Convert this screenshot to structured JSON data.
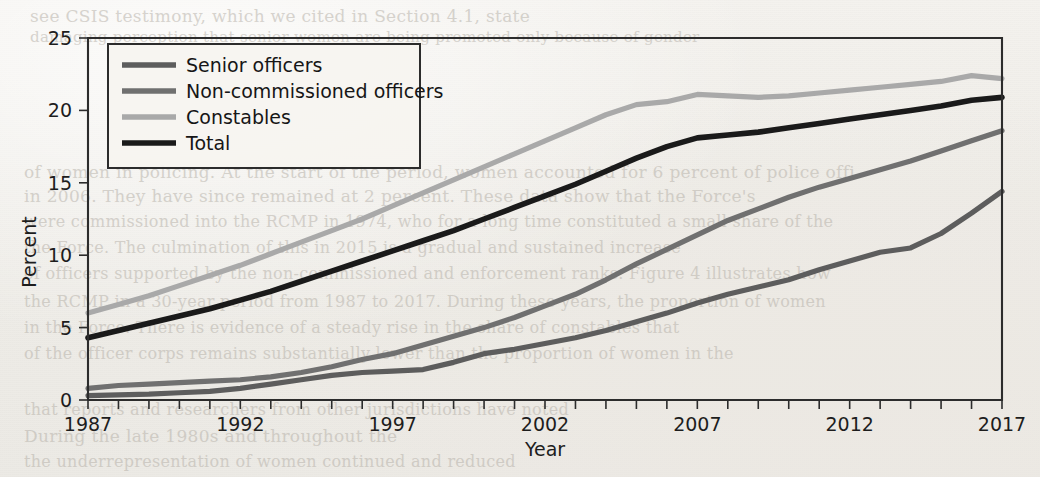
{
  "figure": {
    "background_color": "#f1efeb",
    "frame_color": "#2c2c2c"
  },
  "bleed_through_text": [
    {
      "text": "see CSIS testimony, which we cited in Section 4.1, state",
      "x": 30,
      "y": 6,
      "size": 17
    },
    {
      "text": "damaging perception that senior women are being promoted only because of gender",
      "x": 30,
      "y": 28,
      "size": 15
    },
    {
      "text": "of women in policing. At the start of the period, women accounted for 6 percent of police offi",
      "x": 24,
      "y": 162,
      "size": 17
    },
    {
      "text": "in 2006. They have since remained at 2 percent. These data show that the Force's",
      "x": 24,
      "y": 186,
      "size": 17
    },
    {
      "text": "were commissioned into the RCMP in 1974, who for a long time constituted a small share of the",
      "x": 24,
      "y": 212,
      "size": 16
    },
    {
      "text": "the Force. The culmination of this in 2015 is a gradual and sustained increase",
      "x": 24,
      "y": 238,
      "size": 16
    },
    {
      "text": "of officers supported by the non-commissioned and enforcement ranks. Figure 4 illustrates how",
      "x": 24,
      "y": 264,
      "size": 16
    },
    {
      "text": "the RCMP in a 30-year period from 1987 to 2017. During these years, the proportion of women",
      "x": 24,
      "y": 292,
      "size": 16
    },
    {
      "text": "in the Force. There is evidence of a steady rise in the share of constables that",
      "x": 24,
      "y": 318,
      "size": 16
    },
    {
      "text": "of the officer corps remains substantially lower than the proportion of women in the",
      "x": 24,
      "y": 344,
      "size": 16
    },
    {
      "text": "that reports and researchers from other jurisdictions have noted",
      "x": 24,
      "y": 400,
      "size": 16
    },
    {
      "text": "During the late 1980s and throughout the",
      "x": 24,
      "y": 426,
      "size": 17
    },
    {
      "text": "the underrepresentation of women continued and reduced",
      "x": 24,
      "y": 452,
      "size": 16
    }
  ],
  "chart_data": {
    "type": "line",
    "title": "",
    "xlabel": "Year",
    "ylabel": "Percent",
    "xlim": [
      1987,
      2017
    ],
    "ylim": [
      0,
      25
    ],
    "ytick_values": [
      0,
      5,
      10,
      15,
      20,
      25
    ],
    "ytick_labels": [
      "0",
      "5",
      "10",
      "15",
      "20",
      "25"
    ],
    "xtick_values": [
      1987,
      1988,
      1989,
      1990,
      1991,
      1992,
      1993,
      1994,
      1995,
      1996,
      1997,
      1998,
      1999,
      2000,
      2001,
      2002,
      2003,
      2004,
      2005,
      2006,
      2007,
      2008,
      2009,
      2010,
      2011,
      2012,
      2013,
      2014,
      2015,
      2016,
      2017
    ],
    "xtick_labels_shown": [
      "1987",
      "1992",
      "1997",
      "2002",
      "2007",
      "2012",
      "2017"
    ],
    "grid": false,
    "legend_position": "upper left (inside axes)",
    "x": [
      1987,
      1988,
      1989,
      1990,
      1991,
      1992,
      1993,
      1994,
      1995,
      1996,
      1997,
      1998,
      1999,
      2000,
      2001,
      2002,
      2003,
      2004,
      2005,
      2006,
      2007,
      2008,
      2009,
      2010,
      2011,
      2012,
      2013,
      2014,
      2015,
      2016,
      2017
    ],
    "series": [
      {
        "name": "Senior officers",
        "color": "#5d5d5d",
        "values": [
          0.3,
          0.35,
          0.4,
          0.5,
          0.6,
          0.8,
          1.1,
          1.4,
          1.7,
          1.9,
          2.0,
          2.1,
          2.6,
          3.2,
          3.5,
          3.9,
          4.3,
          4.8,
          5.4,
          6.0,
          6.7,
          7.3,
          7.8,
          8.3,
          9.0,
          9.6,
          10.2,
          10.5,
          11.5,
          12.9,
          14.4
        ]
      },
      {
        "name": "Non-commissioned officers",
        "color": "#707070",
        "values": [
          0.8,
          1.0,
          1.1,
          1.2,
          1.3,
          1.4,
          1.6,
          1.9,
          2.3,
          2.8,
          3.2,
          3.8,
          4.4,
          5.0,
          5.7,
          6.5,
          7.3,
          8.3,
          9.4,
          10.4,
          11.4,
          12.4,
          13.2,
          14.0,
          14.7,
          15.3,
          15.9,
          16.5,
          17.2,
          17.9,
          18.6
        ]
      },
      {
        "name": "Constables",
        "color": "#a9a9a9",
        "values": [
          6.0,
          6.6,
          7.2,
          7.9,
          8.6,
          9.3,
          10.1,
          10.9,
          11.7,
          12.5,
          13.4,
          14.3,
          15.2,
          16.1,
          17.0,
          17.9,
          18.8,
          19.7,
          20.4,
          20.6,
          21.1,
          21.0,
          20.9,
          21.0,
          21.2,
          21.4,
          21.6,
          21.8,
          22.0,
          22.4,
          22.2
        ]
      },
      {
        "name": "Total",
        "color": "#1a1a1a",
        "values": [
          4.3,
          4.8,
          5.3,
          5.8,
          6.3,
          6.9,
          7.5,
          8.2,
          8.9,
          9.6,
          10.3,
          11.0,
          11.7,
          12.5,
          13.3,
          14.1,
          14.9,
          15.8,
          16.7,
          17.5,
          18.1,
          18.3,
          18.5,
          18.8,
          19.1,
          19.4,
          19.7,
          20.0,
          20.3,
          20.7,
          20.9
        ]
      }
    ]
  }
}
